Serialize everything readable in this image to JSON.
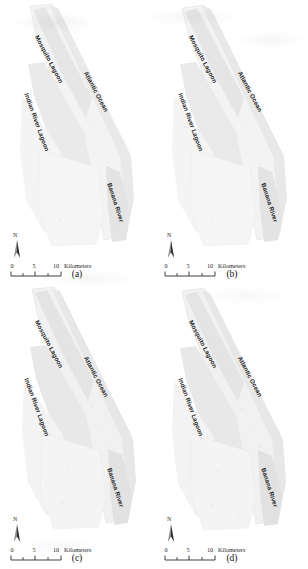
{
  "figure": {
    "layout": "2x2",
    "background_color": "#ffffff",
    "region_subject": "Indian River Lagoon estuary system, Florida"
  },
  "map_labels": {
    "mosquito_lagoon": "Mosquito Lagoon",
    "atlantic_ocean": "Atlantic Ocean",
    "indian_river_lagoon": "Indian River Lagoon",
    "banana_river": "Banana River"
  },
  "scale_bar": {
    "ticks": [
      "0",
      "5",
      "10"
    ],
    "units": "Kilometers"
  },
  "north_arrow": {
    "letter": "N"
  },
  "colors": {
    "water_light": "#ededed",
    "water_mid": "#e2e2e2",
    "land_tint": "#f2f2f2",
    "outline": "#d8d8d8",
    "text": "#1b1b1b"
  },
  "panels": [
    {
      "id": "a",
      "caption": "(a)"
    },
    {
      "id": "b",
      "caption": "(b)"
    },
    {
      "id": "c",
      "caption": "(c)"
    },
    {
      "id": "d",
      "caption": "(d)"
    }
  ]
}
